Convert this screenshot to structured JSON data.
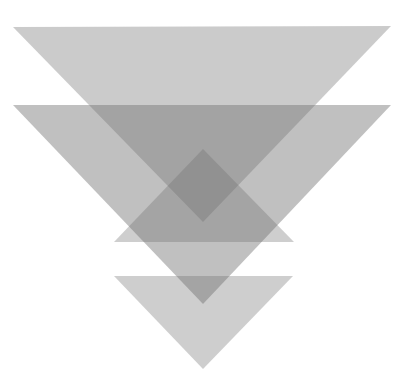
{
  "figure": {
    "canvas": {
      "width": 410,
      "height": 386,
      "background": "#ffffff"
    },
    "fill_color": "#707070",
    "shapes": [
      {
        "id": "top-down-triangle",
        "kind": "triangle-down",
        "points": "13,27 391,26 203,222",
        "opacity": 0.36
      },
      {
        "id": "middle-down-triangle",
        "kind": "triangle-down",
        "points": "13,105 391,105 203,304",
        "opacity": 0.44
      },
      {
        "id": "up-triangle",
        "kind": "triangle-up",
        "points": "203,149 114,242 294,242",
        "opacity": 0.34
      },
      {
        "id": "bottom-down-triangle",
        "kind": "triangle-down",
        "points": "114,276 293,276 203,369",
        "opacity": 0.34
      }
    ]
  }
}
